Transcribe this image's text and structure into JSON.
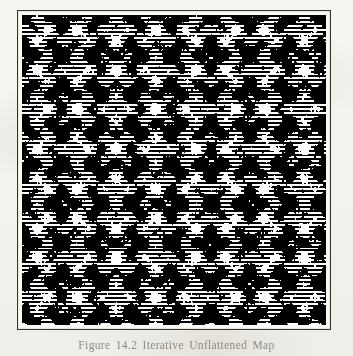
{
  "page": {
    "background_color": "#f4f3ef",
    "ink_color": "#35332e"
  },
  "figure": {
    "frame_color": "#35332e",
    "caption": "Figure 14.2  Iterative Unflattened Map",
    "caption_color": "#8d8a84"
  },
  "chart_data": {
    "type": "heatmap",
    "title": "Figure 14.2  Iterative Unflattened Map",
    "xlabel": "",
    "ylabel": "",
    "grid": false,
    "legend": false,
    "colormap": [
      "#000000",
      "#ffffff"
    ],
    "dither_cell_px": 2,
    "lattice_period_px": 38,
    "xlim": [
      0,
      1
    ],
    "ylim": [
      0,
      1
    ],
    "resolution": [
      306,
      312
    ],
    "value_range": [
      0,
      1
    ],
    "mean_density": 0.62,
    "field": {
      "formula": "cos(2*pi*x/38) + cos(2*pi*y/38) + 0.85*cos(2*pi*(x+y)/27) + 0.85*cos(2*pi*(x-y)/27) + 0.55*cos(2*pi*x/9.5)*cos(2*pi*y/9.5)",
      "threshold_base": 0.18,
      "samples": [
        {
          "x": 0.0,
          "y": 0.0,
          "value": 1.0
        },
        {
          "x": 0.25,
          "y": 0.0,
          "value": 0.31
        },
        {
          "x": 0.5,
          "y": 0.0,
          "value": 0.94
        },
        {
          "x": 0.75,
          "y": 0.0,
          "value": 0.28
        },
        {
          "x": 1.0,
          "y": 0.0,
          "value": 1.0
        },
        {
          "x": 0.0,
          "y": 0.25,
          "value": 0.33
        },
        {
          "x": 0.25,
          "y": 0.25,
          "value": 0.71
        },
        {
          "x": 0.5,
          "y": 0.25,
          "value": 0.4
        },
        {
          "x": 0.75,
          "y": 0.25,
          "value": 0.69
        },
        {
          "x": 1.0,
          "y": 0.25,
          "value": 0.35
        },
        {
          "x": 0.0,
          "y": 0.5,
          "value": 0.92
        },
        {
          "x": 0.25,
          "y": 0.5,
          "value": 0.42
        },
        {
          "x": 0.5,
          "y": 0.5,
          "value": 0.88
        },
        {
          "x": 0.75,
          "y": 0.5,
          "value": 0.44
        },
        {
          "x": 1.0,
          "y": 0.5,
          "value": 0.91
        },
        {
          "x": 0.0,
          "y": 0.75,
          "value": 0.29
        },
        {
          "x": 0.25,
          "y": 0.75,
          "value": 0.67
        },
        {
          "x": 0.5,
          "y": 0.75,
          "value": 0.43
        },
        {
          "x": 0.75,
          "y": 0.75,
          "value": 0.73
        },
        {
          "x": 1.0,
          "y": 0.75,
          "value": 0.3
        },
        {
          "x": 0.0,
          "y": 1.0,
          "value": 1.0
        },
        {
          "x": 0.25,
          "y": 1.0,
          "value": 0.27
        },
        {
          "x": 0.5,
          "y": 1.0,
          "value": 0.95
        },
        {
          "x": 0.75,
          "y": 1.0,
          "value": 0.26
        },
        {
          "x": 1.0,
          "y": 1.0,
          "value": 1.0
        }
      ]
    }
  }
}
